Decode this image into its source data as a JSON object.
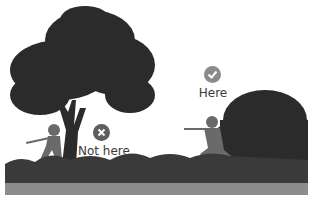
{
  "markers": {
    "good": {
      "label": "Here",
      "icon": "checkmark-icon",
      "color": "#8a8a8a"
    },
    "bad": {
      "label": "Not here",
      "icon": "cross-icon",
      "color": "#5e5e5e"
    }
  },
  "colors": {
    "foliage": "#2b2b2b",
    "soldier": "#6a6a6a",
    "ground": "#8c8c8c",
    "background": "#ffffff"
  }
}
